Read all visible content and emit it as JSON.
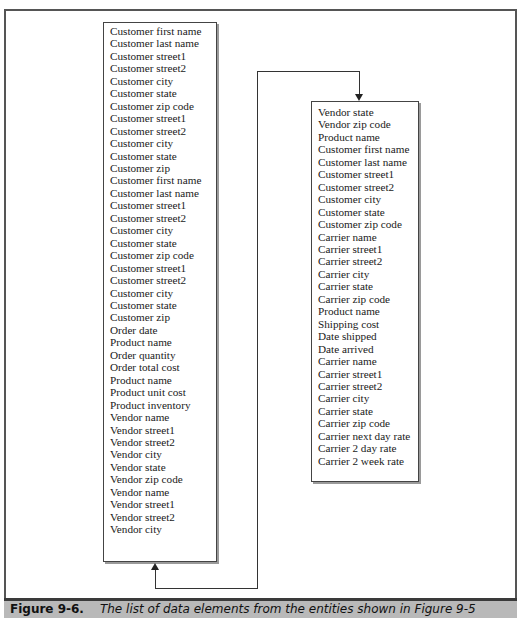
{
  "figure": {
    "label": "Figure 9-6.",
    "caption": "The list of data elements from the entities shown in Figure 9-5"
  },
  "left_list": {
    "items": [
      "Customer first name",
      "Customer last name",
      "Customer street1",
      "Customer street2",
      "Customer city",
      "Customer state",
      "Customer zip code",
      "Customer street1",
      "Customer street2",
      "Customer city",
      "Customer state",
      "Customer zip",
      "Customer first name",
      "Customer last name",
      "Customer street1",
      "Customer street2",
      "Customer city",
      "Customer state",
      "Customer zip code",
      "Customer street1",
      "Customer street2",
      "Customer city",
      "Customer state",
      "Customer zip",
      "Order date",
      "Product name",
      "Order quantity",
      "Order total cost",
      "Product name",
      "Product unit cost",
      "Product inventory",
      "Vendor name",
      "Vendor street1",
      "Vendor street2",
      "Vendor city",
      "Vendor state",
      "Vendor zip code",
      "Vendor name",
      "Vendor street1",
      "Vendor street2",
      "Vendor city"
    ]
  },
  "right_list": {
    "items": [
      "Vendor state",
      "Vendor zip code",
      "Product name",
      "Customer first name",
      "Customer last name",
      "Customer street1",
      "Customer street2",
      "Customer city",
      "Customer state",
      "Customer zip code",
      "Carrier name",
      "Carrier street1",
      "Carrier street2",
      "Carrier city",
      "Carrier state",
      "Carrier zip code",
      "Product name",
      "Shipping cost",
      "Date shipped",
      "Date arrived",
      "Carrier name",
      "Carrier street1",
      "Carrier street2",
      "Carrier city",
      "Carrier state",
      "Carrier zip code",
      "Carrier next day rate",
      "Carrier 2 day rate",
      "Carrier 2 week rate"
    ]
  },
  "connector": {
    "from": "left_list",
    "to": "right_list",
    "meaning": "list continues from left column to right column"
  }
}
